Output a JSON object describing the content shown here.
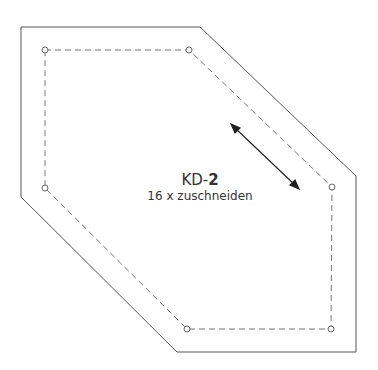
{
  "pattern": {
    "code_prefix": "KD-",
    "code_number": "2",
    "instruction": "16 x zuschneiden",
    "outline_color": "#555555",
    "seam_color": "#777777"
  }
}
